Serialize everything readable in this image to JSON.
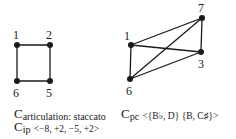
{
  "diagram": {
    "graphs": [
      {
        "id": "articulation-graph",
        "nodes": [
          {
            "label": "1",
            "x": 17,
            "y": 45,
            "lx": 13,
            "ly": 39
          },
          {
            "label": "2",
            "x": 50,
            "y": 45,
            "lx": 46,
            "ly": 39
          },
          {
            "label": "5",
            "x": 50,
            "y": 81,
            "lx": 46,
            "ly": 97
          },
          {
            "label": "6",
            "x": 17,
            "y": 81,
            "lx": 13,
            "ly": 97
          }
        ],
        "edges": [
          [
            "1",
            "2"
          ],
          [
            "2",
            "5"
          ],
          [
            "5",
            "6"
          ],
          [
            "6",
            "1"
          ]
        ]
      },
      {
        "id": "pitch-class-graph",
        "nodes": [
          {
            "label": "7",
            "x": 202,
            "y": 18,
            "lx": 198,
            "ly": 12
          },
          {
            "label": "1",
            "x": 131,
            "y": 45,
            "lx": 124,
            "ly": 40
          },
          {
            "label": "3",
            "x": 201,
            "y": 52,
            "lx": 198,
            "ly": 68
          },
          {
            "label": "6",
            "x": 130,
            "y": 79,
            "lx": 126,
            "ly": 95
          }
        ],
        "edges": [
          [
            "1",
            "7"
          ],
          [
            "7",
            "3"
          ],
          [
            "1",
            "3"
          ],
          [
            "1",
            "6"
          ],
          [
            "6",
            "7"
          ],
          [
            "6",
            "3"
          ]
        ]
      }
    ],
    "captions": {
      "articulation": {
        "main": "C",
        "sub": "articulation: staccato",
        "value": ""
      },
      "ip": {
        "main": "C",
        "sub": "ip",
        "value": "<−8, +2, −5, +2>"
      },
      "pc": {
        "main": "C",
        "sub": "pc",
        "value": "<{B♭, D} {B, C♯}>"
      }
    },
    "colors": {
      "ink": "#1a1a1a",
      "background": "#ffffff"
    }
  }
}
